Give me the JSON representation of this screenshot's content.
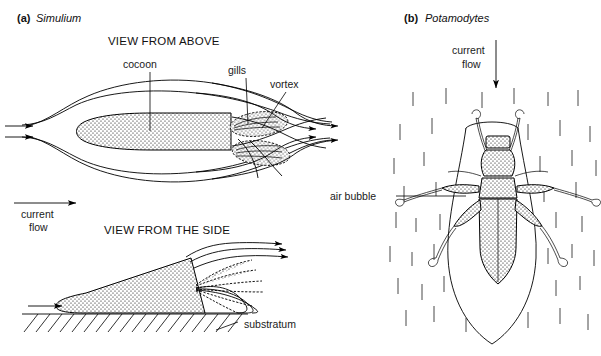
{
  "figure": {
    "width": 601,
    "height": 356,
    "background_color": "#ffffff",
    "ink_color": "#000000"
  },
  "panel_a": {
    "letter": "(a)",
    "taxon": "Simulium",
    "view_above_title": "VIEW FROM ABOVE",
    "view_side_title": "VIEW FROM THE SIDE",
    "labels": {
      "cocoon": "cocoon",
      "gills": "gills",
      "vortex": "vortex",
      "current_flow_line1": "current",
      "current_flow_line2": "flow",
      "substratum": "substratum"
    }
  },
  "panel_b": {
    "letter": "(b)",
    "taxon": "Potamodytes",
    "labels": {
      "current_flow_line1": "current",
      "current_flow_line2": "flow",
      "air_bubble": "air bubble"
    }
  },
  "icons": {
    "flow_arrow": "arrow-right-icon",
    "down_arrow": "arrow-down-icon",
    "stipple": "stipple-texture",
    "hatching": "hatch-texture",
    "rain_dashes": "vertical-dash-field"
  }
}
